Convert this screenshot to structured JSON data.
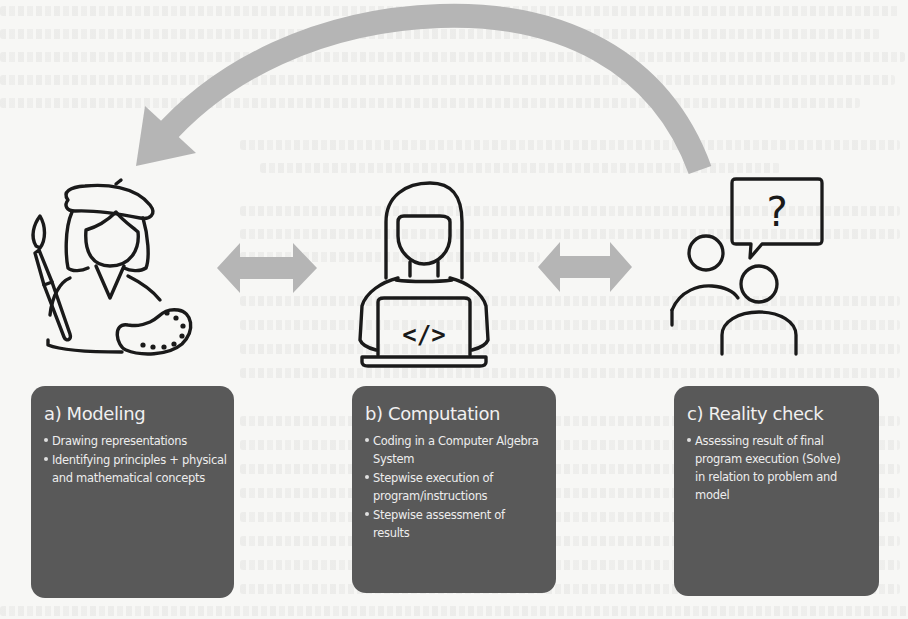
{
  "diagram": {
    "colors": {
      "background": "#f7f7f5",
      "box_fill": "#595959",
      "box_text": "#ededed",
      "arrow_fill": "#b5b5b5",
      "icon_stroke": "#1a1a1a"
    },
    "cycle_arrow": {
      "direction": "from reality check back to modeling",
      "icon": "curved-arrow-icon"
    },
    "connectors": [
      {
        "between": [
          "modeling",
          "computation"
        ],
        "icon": "double-arrow-icon"
      },
      {
        "between": [
          "computation",
          "reality-check"
        ],
        "icon": "double-arrow-icon"
      }
    ],
    "stages": [
      {
        "id": "modeling",
        "icon": "artist-with-palette-icon",
        "title": "a) Modeling",
        "bullets": [
          "Drawing representations",
          "Identifying principles + physical and mathematical concepts"
        ]
      },
      {
        "id": "computation",
        "icon": "programmer-with-laptop-icon",
        "code_glyph": "</>",
        "title": "b) Computation",
        "bullets": [
          "Coding in a Computer Algebra System",
          "Stepwise execution of program/instructions",
          "Stepwise assessment of results"
        ]
      },
      {
        "id": "reality-check",
        "icon": "people-question-icon",
        "speech_glyph": "?",
        "title": "c) Reality check",
        "bullets": [
          "Assessing result of final program execution (Solve) in relation to problem and model"
        ]
      }
    ]
  }
}
